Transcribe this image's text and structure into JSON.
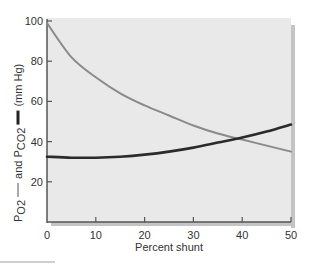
{
  "chart_data": {
    "type": "line",
    "title": "",
    "xlabel": "Percent shunt",
    "ylabel": {
      "po2_text": "P",
      "po2_sub": "O2",
      "po2_legend": "thin gray line",
      "and_text": "and P",
      "pco2_sub": "CO2",
      "pco2_legend": "thick dark line",
      "units": "(mm Hg)"
    },
    "xlim": [
      0,
      50
    ],
    "ylim": [
      0,
      100
    ],
    "x_ticks": [
      0,
      10,
      20,
      30,
      40,
      50
    ],
    "x_tick_labels": [
      "0",
      "10",
      "20",
      "30",
      "40",
      "50"
    ],
    "y_ticks": [
      20,
      40,
      60,
      80,
      100
    ],
    "y_tick_labels": [
      "20",
      "40",
      "60",
      "80",
      "100"
    ],
    "grid": false,
    "legend": "embedded in y-axis label",
    "x": [
      0,
      5,
      10,
      15,
      20,
      25,
      30,
      35,
      40,
      45,
      50
    ],
    "series": [
      {
        "name": "PO2",
        "style": "thin",
        "color": "#8a8a8a",
        "values": [
          99,
          82,
          72,
          64,
          58,
          53,
          48,
          44,
          41,
          38,
          35
        ]
      },
      {
        "name": "PCO2",
        "style": "thick",
        "color": "#2b2b2b",
        "values": [
          32.5,
          32,
          32,
          32.5,
          33.5,
          35,
          37,
          39.5,
          42,
          45,
          48.5
        ]
      }
    ],
    "colors": {
      "plot_background": "#e9e9e9",
      "shadow": "#c4c4c4",
      "axis": "#555555"
    }
  }
}
